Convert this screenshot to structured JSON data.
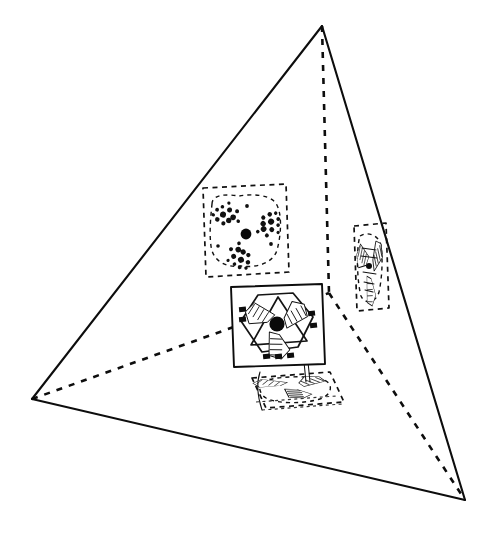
{
  "figure": {
    "title": "Tetrahedral arrangement of four three-fold molecular motifs",
    "caption": "",
    "canvas": {
      "width": 489,
      "height": 533,
      "background": "#ffffff"
    },
    "palette": {
      "ink": "#0d0d0d",
      "dash_ink": "#111111",
      "paper": "#ffffff",
      "core_dot": "#0a0a0a"
    },
    "line_styles": {
      "visible_edge": "solid",
      "hidden_edge": "dashed",
      "projected_panel": "dashed",
      "front_panel": "solid"
    }
  },
  "tetrahedron": {
    "name": "outer-tetrahedron",
    "vertices": [
      {
        "id": "apex",
        "label": "top vertex",
        "x": 322,
        "y": 26
      },
      {
        "id": "left",
        "label": "left vertex",
        "x": 32,
        "y": 399
      },
      {
        "id": "right",
        "label": "lower right vertex",
        "x": 465,
        "y": 500
      },
      {
        "id": "back",
        "label": "hidden rear vertex",
        "x": 329,
        "y": 293
      }
    ],
    "visible_edges": [
      {
        "from": "apex",
        "to": "left"
      },
      {
        "from": "left",
        "to": "right"
      },
      {
        "from": "right",
        "to": "apex"
      }
    ],
    "hidden_edges": [
      {
        "from": "apex",
        "to": "back"
      },
      {
        "from": "left",
        "to": "back"
      },
      {
        "from": "right",
        "to": "back"
      }
    ]
  },
  "motifs": [
    {
      "id": "motif-top",
      "label": "upper projected motif",
      "style": "dashed-outline-speckled",
      "center": {
        "x": 245,
        "y": 232
      },
      "panel": "dashed square seen near face-on",
      "symmetry": "3-fold",
      "has_core_dot": true,
      "blade_count": 3
    },
    {
      "id": "motif-center",
      "label": "front facing motif",
      "style": "solid-outline-hatched",
      "center": {
        "x": 277,
        "y": 325
      },
      "panel": "solid quadrilateral with hexagon and triangle",
      "symmetry": "3-fold",
      "has_core_dot": true,
      "blade_count": 3
    },
    {
      "id": "motif-right",
      "label": "right edge-on motif",
      "style": "dashed-outline-compressed",
      "center": {
        "x": 370,
        "y": 268
      },
      "panel": "narrow dashed rectangle seen edge-on",
      "symmetry": "3-fold",
      "has_core_dot": false,
      "blade_count": 3
    },
    {
      "id": "motif-bottom",
      "label": "lower foreshortened motif",
      "style": "dashed-outline-flattened",
      "center": {
        "x": 292,
        "y": 386
      },
      "panel": "flattened dashed parallelogram",
      "symmetry": "3-fold",
      "has_core_dot": false,
      "blade_count": 3
    }
  ],
  "chart_data": {
    "type": "scatter",
    "title": "Tetrahedral arrangement of four three-fold molecular motifs",
    "xlabel": "",
    "ylabel": "",
    "legend": [],
    "grid": false,
    "annotations": [],
    "series": [
      {
        "name": "tetrahedron vertices",
        "x": [
          322,
          32,
          465,
          329
        ],
        "y": [
          26,
          399,
          500,
          293
        ],
        "labels": [
          "apex",
          "left",
          "right",
          "back-hidden"
        ]
      },
      {
        "name": "motif centers",
        "x": [
          245,
          277,
          370,
          292
        ],
        "y": [
          232,
          325,
          268,
          386
        ],
        "labels": [
          "motif-top",
          "motif-center",
          "motif-right",
          "motif-bottom"
        ]
      }
    ]
  }
}
